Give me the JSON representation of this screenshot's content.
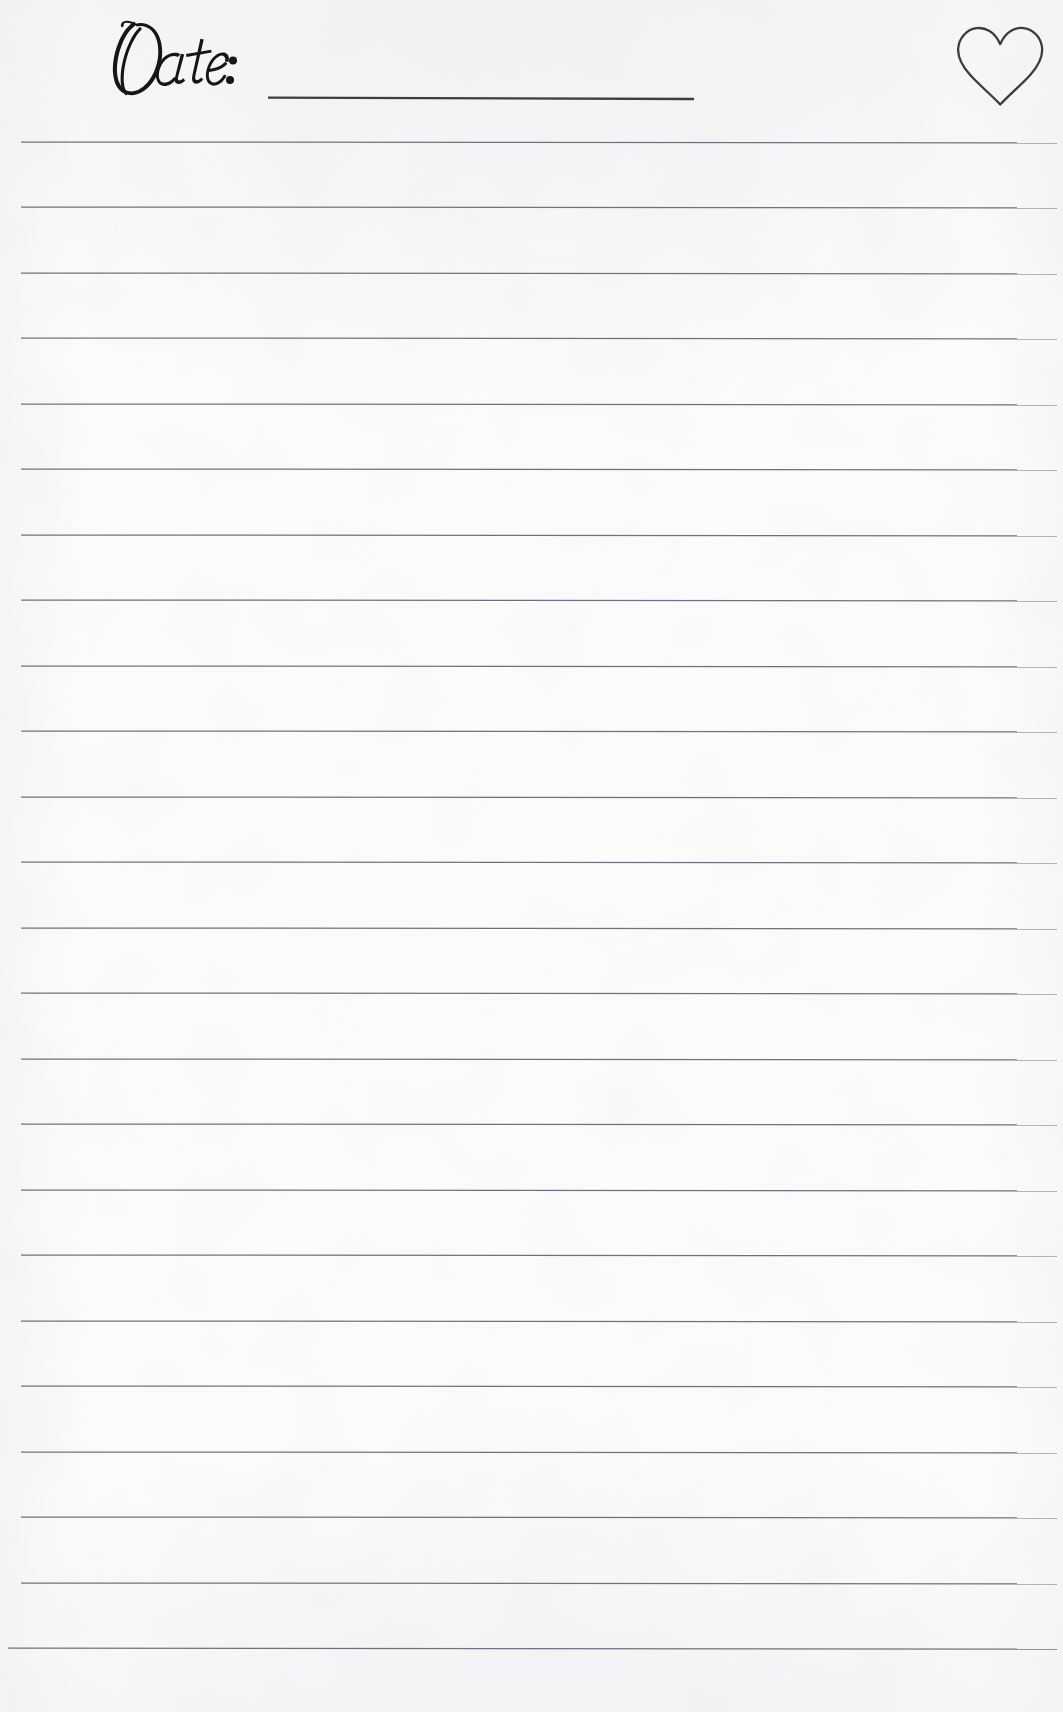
{
  "page": {
    "kind": "lined-journal-page",
    "width": 1063,
    "height": 1712,
    "background_color": "#fdfdfd",
    "ink_color": "#2f3136",
    "rule_color": "#6f7379"
  },
  "header": {
    "date_label": "Date:",
    "date_field": {
      "value": "",
      "placeholder": "",
      "x": 268,
      "y": 96,
      "width": 426
    },
    "icon": {
      "name": "heart-icon",
      "style": "outline",
      "stroke_color": "#3a3c42",
      "x": 953,
      "y": 22,
      "width": 94,
      "height": 88
    }
  },
  "ruled_lines": {
    "count": 24,
    "first_line_y": 142,
    "spacing": 65.5,
    "left_x": 20,
    "right_x": 1057,
    "color": "#6f7379",
    "positions": [
      142,
      207.5,
      273,
      338.5,
      404,
      469.5,
      535,
      600.5,
      666,
      731.5,
      797,
      862.5,
      928,
      993.5,
      1059,
      1124.5,
      1190,
      1255.5,
      1321,
      1386.5,
      1452,
      1517.5,
      1583,
      1648.5
    ]
  },
  "write_zones": {
    "count": 24,
    "value": ""
  }
}
